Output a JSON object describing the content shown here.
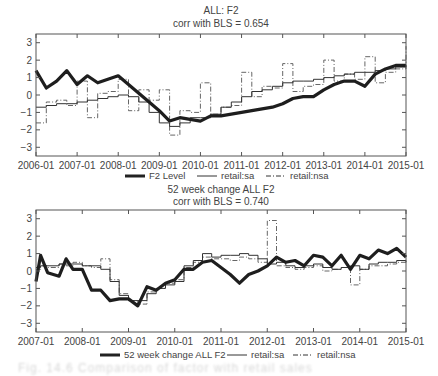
{
  "chart_data": [
    {
      "type": "line",
      "title": "ALL: F2",
      "subtitle": "corr with BLS = 0.654",
      "xlabel": "",
      "ylabel": "",
      "ylim": [
        -3.5,
        3.5
      ],
      "yticks": [
        -3,
        -2,
        -1,
        0,
        1,
        2,
        3
      ],
      "xticks": [
        "2006-01",
        "2007-01",
        "2008-01",
        "2009-01",
        "2010-01",
        "2011-01",
        "2012-01",
        "2013-01",
        "2014-01",
        "2015-01"
      ],
      "x_range": [
        2006.0,
        2015.0
      ],
      "grid": false,
      "legend_position": "bottom",
      "x": [
        2006.0,
        2006.25,
        2006.5,
        2006.75,
        2007.0,
        2007.25,
        2007.5,
        2007.75,
        2008.0,
        2008.25,
        2008.5,
        2008.75,
        2009.0,
        2009.25,
        2009.5,
        2009.75,
        2010.0,
        2010.25,
        2010.5,
        2010.75,
        2011.0,
        2011.25,
        2011.5,
        2011.75,
        2012.0,
        2012.25,
        2012.5,
        2012.75,
        2013.0,
        2013.25,
        2013.5,
        2013.75,
        2014.0,
        2014.25,
        2014.5,
        2014.75,
        2015.0
      ],
      "series": [
        {
          "name": "F2 Level",
          "style": "thick",
          "values": [
            1.4,
            0.4,
            0.8,
            1.4,
            0.6,
            1.1,
            0.7,
            0.9,
            1.1,
            0.6,
            0.1,
            -0.4,
            -0.9,
            -1.5,
            -1.3,
            -1.4,
            -1.5,
            -1.2,
            -1.2,
            -1.1,
            -1.0,
            -0.9,
            -0.8,
            -0.7,
            -0.5,
            -0.2,
            -0.1,
            -0.1,
            0.3,
            0.6,
            0.8,
            0.8,
            0.5,
            1.2,
            1.5,
            1.7,
            1.7
          ]
        },
        {
          "name": "retail:sa",
          "style": "thin",
          "values": [
            -0.7,
            -0.6,
            -0.5,
            -0.5,
            -0.4,
            -0.3,
            -0.2,
            -0.1,
            0.0,
            -0.1,
            -0.4,
            -1.0,
            -1.6,
            -1.8,
            -1.6,
            -1.3,
            -1.3,
            -1.1,
            -0.7,
            -0.4,
            -0.1,
            0.2,
            0.3,
            0.5,
            0.7,
            0.8,
            0.8,
            0.9,
            1.0,
            1.1,
            1.2,
            1.3,
            1.3,
            1.4,
            1.5,
            1.6,
            1.7
          ]
        },
        {
          "name": "retail:nsa",
          "style": "dashdot",
          "values": [
            -1.6,
            -0.4,
            -0.3,
            -0.6,
            0.8,
            -1.3,
            0.1,
            0.2,
            0.9,
            -0.9,
            0.3,
            -0.3,
            0.3,
            -2.3,
            -0.9,
            -1.0,
            0.7,
            -1.1,
            -0.7,
            -0.6,
            1.3,
            -0.1,
            0.5,
            0.4,
            1.8,
            0.2,
            0.5,
            0.6,
            2.0,
            0.8,
            1.2,
            0.9,
            2.2,
            0.7,
            1.3,
            1.5,
            2.8
          ]
        }
      ]
    },
    {
      "type": "line",
      "title": "52 week change ALL F2",
      "subtitle": "corr with BLS = 0.740",
      "xlabel": "",
      "ylabel": "",
      "ylim": [
        -3.5,
        3.5
      ],
      "yticks": [
        -3,
        -2,
        -1,
        0,
        1,
        2,
        3
      ],
      "xticks": [
        "2007-01",
        "2008-01",
        "2009-01",
        "2010-01",
        "2011-01",
        "2012-01",
        "2013-01",
        "2014-01",
        "2015-01"
      ],
      "x_range": [
        2007.0,
        2015.0
      ],
      "grid": false,
      "legend_position": "bottom",
      "x": [
        2007.0,
        2007.1,
        2007.25,
        2007.5,
        2007.65,
        2007.8,
        2008.0,
        2008.2,
        2008.4,
        2008.6,
        2008.8,
        2009.0,
        2009.2,
        2009.4,
        2009.6,
        2009.8,
        2010.0,
        2010.2,
        2010.4,
        2010.6,
        2010.8,
        2011.0,
        2011.2,
        2011.4,
        2011.6,
        2011.8,
        2012.0,
        2012.2,
        2012.4,
        2012.6,
        2012.8,
        2013.0,
        2013.2,
        2013.4,
        2013.6,
        2013.8,
        2014.0,
        2014.2,
        2014.4,
        2014.6,
        2014.8,
        2015.0
      ],
      "series": [
        {
          "name": "52 week change ALL F2",
          "style": "thick",
          "values": [
            -0.6,
            0.9,
            -0.1,
            -0.3,
            0.7,
            0.1,
            0.1,
            -1.1,
            -1.1,
            -1.7,
            -1.6,
            -1.6,
            -2.0,
            -0.9,
            -1.1,
            -0.7,
            -0.5,
            0.1,
            0.1,
            0.5,
            0.6,
            0.2,
            -0.2,
            -0.7,
            -0.2,
            0.0,
            0.3,
            0.8,
            0.5,
            0.6,
            0.3,
            0.9,
            0.8,
            0.3,
            0.9,
            0.1,
            0.9,
            0.7,
            1.2,
            1.0,
            1.3,
            0.8
          ]
        },
        {
          "name": "retail:sa",
          "style": "thin",
          "values": [
            0.2,
            0.3,
            0.3,
            0.4,
            0.4,
            0.4,
            0.3,
            0.3,
            0.1,
            -0.6,
            -1.4,
            -1.7,
            -1.7,
            -1.3,
            -1.0,
            -0.8,
            -0.6,
            0.3,
            0.6,
            1.0,
            0.8,
            0.9,
            0.9,
            1.0,
            0.9,
            0.7,
            0.4,
            0.5,
            0.3,
            0.2,
            0.3,
            0.4,
            0.2,
            0.1,
            0.2,
            0.3,
            0.1,
            0.4,
            0.5,
            0.5,
            0.6,
            0.5
          ]
        },
        {
          "name": "retail:nsa",
          "style": "dashdot",
          "values": [
            0.1,
            0.3,
            0.2,
            0.4,
            0.3,
            0.5,
            0.3,
            0.2,
            0.7,
            -0.5,
            -1.3,
            -1.7,
            -1.9,
            -1.2,
            -1.0,
            -0.7,
            -0.5,
            0.2,
            0.5,
            0.8,
            0.7,
            0.7,
            0.6,
            0.8,
            0.7,
            0.5,
            2.9,
            0.3,
            0.2,
            0.1,
            0.2,
            0.3,
            0.0,
            0.1,
            0.2,
            -0.8,
            0.1,
            0.3,
            0.3,
            0.4,
            0.5,
            0.4
          ]
        }
      ]
    }
  ],
  "legend": {
    "top": [
      "F2 Level",
      "retail:sa",
      "retail:nsa"
    ],
    "bottom": [
      "52 week change ALL F2",
      "retail:sa",
      "retail:nsa"
    ]
  },
  "caption": "Fig. 14.6 Comparison of factor with retail sales"
}
